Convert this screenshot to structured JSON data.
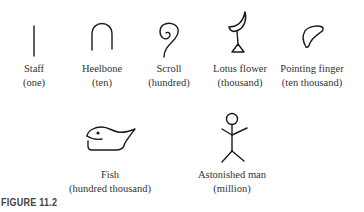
{
  "figure": {
    "caption": "FIGURE 11.2",
    "stroke_color": "#1a1a1a",
    "hieroglyphs": [
      {
        "name": "Staff",
        "value": "(one)",
        "icon": "staff-icon"
      },
      {
        "name": "Heelbone",
        "value": "(ten)",
        "icon": "heelbone-icon"
      },
      {
        "name": "Scroll",
        "value": "(hundred)",
        "icon": "scroll-icon"
      },
      {
        "name": "Lotus flower",
        "value": "(thousand)",
        "icon": "lotus-flower-icon"
      },
      {
        "name": "Pointing finger",
        "value": "(ten thousand)",
        "icon": "pointing-finger-icon"
      },
      {
        "name": "Fish",
        "value": "(hundred thousand)",
        "icon": "fish-icon"
      },
      {
        "name": "Astonished man",
        "value": "(million)",
        "icon": "astonished-man-icon"
      }
    ]
  }
}
